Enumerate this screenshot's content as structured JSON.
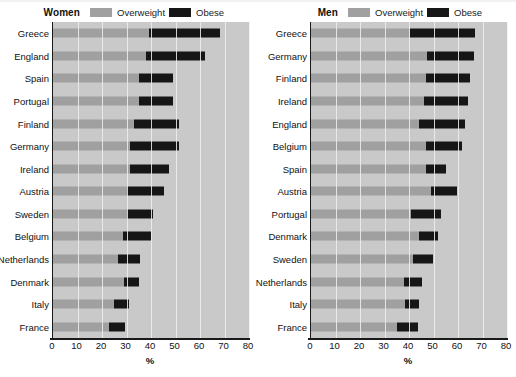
{
  "figure": {
    "width": 516,
    "height": 377,
    "background_color": "#ffffff",
    "plot_background_color": "#c9c9c9",
    "gridline_color": "#f0f0f0"
  },
  "legend": {
    "overweight_label": "Overweight",
    "obese_label": "Obese",
    "overweight_color": "#a0a0a0",
    "obese_color": "#161616"
  },
  "panels": [
    {
      "id": "women",
      "title": "Women"
    },
    {
      "id": "men",
      "title": "Men"
    }
  ],
  "axis": {
    "xlabel": "%",
    "ticks": [
      0,
      10,
      20,
      30,
      40,
      50,
      60,
      70,
      80
    ],
    "tick_labels": [
      "0",
      "10",
      "20",
      "30",
      "40",
      "50",
      "60",
      "70",
      "80"
    ],
    "xlim": [
      0,
      80
    ]
  },
  "chart_data": [
    {
      "type": "bar",
      "orientation": "horizontal",
      "title": "Women",
      "xlabel": "%",
      "ylabel": "",
      "xlim": [
        0,
        80
      ],
      "grid": true,
      "stacked": true,
      "legend_position": "top",
      "categories": [
        "Greece",
        "England",
        "Spain",
        "Portugal",
        "Finland",
        "Germany",
        "Ireland",
        "Austria",
        "Sweden",
        "Belgium",
        "Netherlands",
        "Denmark",
        "Italy",
        "France"
      ],
      "series": [
        {
          "name": "Overweight",
          "color": "#a0a0a0",
          "values": [
            39.3,
            38.0,
            35.0,
            35.0,
            33.0,
            31.5,
            31.5,
            30.0,
            30.0,
            28.5,
            26.5,
            29.0,
            25.0,
            23.0
          ]
        },
        {
          "name": "Obese",
          "color": "#161616",
          "values": [
            28.7,
            24.0,
            14.0,
            14.0,
            18.5,
            20.0,
            16.0,
            15.5,
            11.0,
            11.5,
            9.0,
            6.0,
            6.0,
            6.5
          ]
        }
      ],
      "totals": [
        68.0,
        62.0,
        49.0,
        49.0,
        51.5,
        51.5,
        47.5,
        45.5,
        41.0,
        40.0,
        35.5,
        35.0,
        31.0,
        29.5
      ]
    },
    {
      "type": "bar",
      "orientation": "horizontal",
      "title": "Men",
      "xlabel": "%",
      "ylabel": "",
      "xlim": [
        0,
        80
      ],
      "grid": true,
      "stacked": true,
      "legend_position": "top",
      "categories": [
        "Greece",
        "Germany",
        "Finland",
        "Ireland",
        "England",
        "Belgium",
        "Spain",
        "Austria",
        "Portugal",
        "Denmark",
        "Sweden",
        "Netherlands",
        "Italy",
        "France"
      ],
      "series": [
        {
          "name": "Overweight",
          "color": "#a0a0a0",
          "values": [
            40.5,
            47.5,
            47.0,
            46.0,
            44.0,
            47.0,
            47.0,
            49.0,
            41.0,
            44.0,
            41.5,
            38.0,
            38.5,
            35.0
          ]
        },
        {
          "name": "Obese",
          "color": "#161616",
          "values": [
            26.5,
            19.0,
            18.0,
            18.0,
            19.0,
            14.5,
            8.0,
            10.5,
            12.0,
            8.0,
            8.5,
            7.5,
            5.5,
            8.5
          ]
        }
      ],
      "totals": [
        67.0,
        66.5,
        65.0,
        64.0,
        63.0,
        61.5,
        55.0,
        59.5,
        53.0,
        52.0,
        50.0,
        45.5,
        44.0,
        43.5
      ]
    }
  ]
}
